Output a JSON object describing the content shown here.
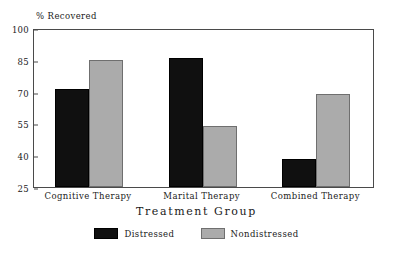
{
  "chart_data": {
    "type": "bar",
    "title": "",
    "categories": [
      "Cognitive Therapy",
      "Marital Therapy",
      "Combined Therapy"
    ],
    "series": [
      {
        "name": "Distressed",
        "color": "#101010",
        "values": [
          71,
          86,
          38
        ]
      },
      {
        "name": "Nondistressed",
        "color": "#ababab",
        "values": [
          85,
          54,
          69
        ]
      }
    ],
    "xlabel": "Treatment Group",
    "ylabel": "% Recovered",
    "ylim": [
      25,
      100
    ],
    "yticks": [
      25,
      40,
      55,
      70,
      85,
      100
    ],
    "grid": false,
    "legend_position": "bottom"
  },
  "axes": {
    "y_title": "% Recovered",
    "x_title": "Treatment Group",
    "y_tick_labels": [
      "100",
      "85",
      "70",
      "55",
      "40",
      "25"
    ]
  },
  "legend": {
    "entries": [
      {
        "label": "Distressed"
      },
      {
        "label": "Nondistressed"
      }
    ]
  }
}
